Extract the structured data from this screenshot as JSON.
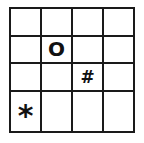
{
  "grid": {
    "rows": 4,
    "cols": 4,
    "line_color": "#1a1a1a",
    "cells": [
      [
        "",
        "",
        "",
        ""
      ],
      [
        "",
        "O",
        "",
        ""
      ],
      [
        "",
        "",
        "#",
        ""
      ],
      [
        "*",
        "",
        "",
        ""
      ]
    ]
  },
  "pieces": [
    {
      "symbol": "O",
      "row": 1,
      "col": 1,
      "name": "circle-piece"
    },
    {
      "symbol": "#",
      "row": 2,
      "col": 2,
      "name": "hash-piece"
    },
    {
      "symbol": "*",
      "row": 3,
      "col": 0,
      "name": "star-piece"
    }
  ]
}
